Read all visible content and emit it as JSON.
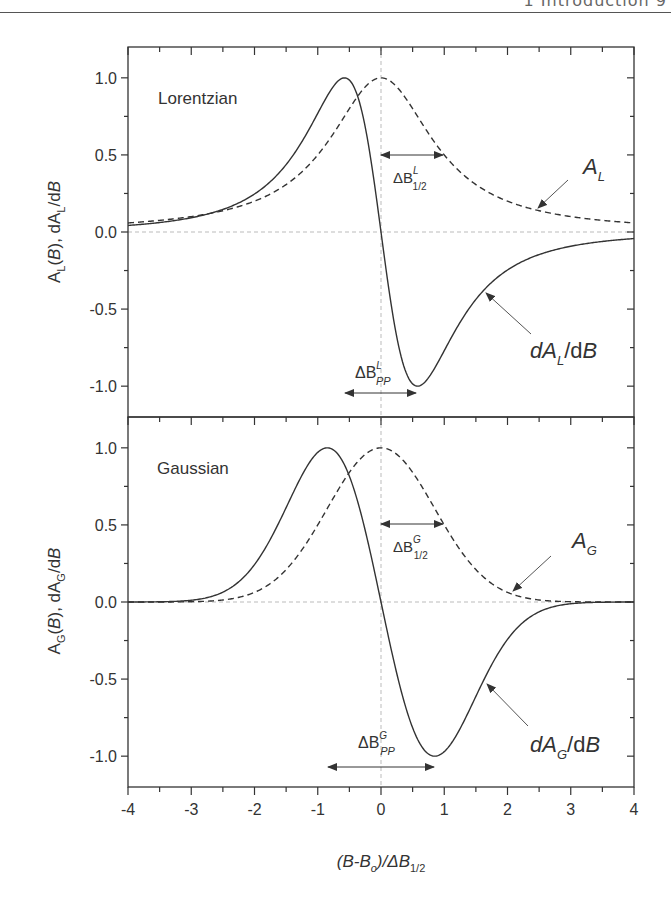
{
  "page_header": {
    "text": "1   Introduction   9"
  },
  "colors": {
    "axis": "#333333",
    "curve": "#333333",
    "guide": "#bbbbbb",
    "arrow": "#555555"
  },
  "chart_data": [
    {
      "type": "line",
      "panel": "top",
      "title": "Lorentzian",
      "xlabel": "(B-B_o)/ΔB_1/2",
      "ylabel": "A_L(B), dA_L/dB",
      "xlim": [
        -4,
        4
      ],
      "ylim": [
        -1.2,
        1.2
      ],
      "xticks": [
        -4,
        -3,
        -2,
        -1,
        0,
        1,
        2,
        3,
        4
      ],
      "yticks": [
        -1.0,
        -0.5,
        0.0,
        0.5,
        1.0
      ],
      "ytick_labels": [
        "-1.0",
        "-0.5",
        "0.0",
        "0.5",
        "1.0"
      ],
      "grid": false,
      "guides": [
        "y=0 dashed",
        "x=0 dashed"
      ],
      "series": [
        {
          "name": "A_L",
          "style": "dashed",
          "x": [
            -4,
            -3,
            -2,
            -1.5,
            -1,
            -0.5,
            0,
            0.5,
            1,
            1.5,
            2,
            3,
            4
          ],
          "y": [
            0.059,
            0.1,
            0.2,
            0.308,
            0.5,
            0.8,
            1.0,
            0.8,
            0.5,
            0.308,
            0.2,
            0.1,
            0.059
          ]
        },
        {
          "name": "dA_L/dB",
          "style": "solid",
          "x": [
            -4,
            -3,
            -2,
            -1.5,
            -1,
            -0.577,
            0,
            0.577,
            1,
            1.5,
            2,
            3,
            4
          ],
          "y": [
            0.043,
            0.092,
            0.246,
            0.438,
            0.77,
            1.0,
            0.0,
            -1.0,
            -0.77,
            -0.438,
            -0.246,
            -0.092,
            -0.043
          ]
        }
      ],
      "annotations": [
        {
          "label": "ΔB",
          "sup": "L",
          "sub": "1/2",
          "meaning": "half width at half max",
          "x_from": 0,
          "x_to": 1,
          "y": 0.5
        },
        {
          "label": "ΔB",
          "sup": "L",
          "sub": "PP",
          "meaning": "peak-to-peak width",
          "x_from": -0.577,
          "x_to": 0.577,
          "y": -1.05
        },
        {
          "label": "A",
          "sub": "L",
          "points_to": "A_L curve at x≈2.4"
        },
        {
          "label": "dA",
          "sub": "L",
          "suffix": "/dB",
          "points_to": "dA_L/dB curve at x≈1.5"
        }
      ]
    },
    {
      "type": "line",
      "panel": "bottom",
      "title": "Gaussian",
      "xlabel": "(B-B_o)/ΔB_1/2",
      "ylabel": "A_G(B), dA_G/dB",
      "xlim": [
        -4,
        4
      ],
      "ylim": [
        -1.2,
        1.2
      ],
      "xticks": [
        -4,
        -3,
        -2,
        -1,
        0,
        1,
        2,
        3,
        4
      ],
      "xtick_labels": [
        "-4",
        "-3",
        "-2",
        "-1",
        "0",
        "1",
        "2",
        "3",
        "4"
      ],
      "yticks": [
        -1.0,
        -0.5,
        0.0,
        0.5,
        1.0
      ],
      "ytick_labels": [
        "-1.0",
        "-0.5",
        "0.0",
        "0.5",
        "1.0"
      ],
      "grid": false,
      "guides": [
        "y=0 dashed",
        "x=0 dashed"
      ],
      "series": [
        {
          "name": "A_G",
          "style": "dashed",
          "x": [
            -4,
            -3,
            -2,
            -1.5,
            -1,
            -0.5,
            0,
            0.5,
            1,
            1.5,
            2,
            3,
            4
          ],
          "y": [
            0.0,
            0.002,
            0.063,
            0.21,
            0.5,
            0.841,
            1.0,
            0.841,
            0.5,
            0.21,
            0.063,
            0.002,
            0.0
          ]
        },
        {
          "name": "dA_G/dB",
          "style": "solid",
          "x": [
            -4,
            -3,
            -2,
            -1.5,
            -0.849,
            0,
            0.849,
            1.5,
            2,
            3,
            4
          ],
          "y": [
            0.0,
            0.009,
            0.181,
            0.456,
            1.0,
            0.0,
            -1.0,
            -0.456,
            -0.181,
            -0.009,
            0.0
          ]
        }
      ],
      "annotations": [
        {
          "label": "ΔB",
          "sup": "G",
          "sub": "1/2",
          "meaning": "half width at half max",
          "x_from": 0,
          "x_to": 1,
          "y": 0.5
        },
        {
          "label": "ΔB",
          "sup": "G",
          "sub": "PP",
          "meaning": "peak-to-peak width",
          "x_from": -0.849,
          "x_to": 0.849,
          "y": -1.1
        },
        {
          "label": "A",
          "sub": "G",
          "points_to": "A_G curve at x≈2.1"
        },
        {
          "label": "dA",
          "sub": "G",
          "suffix": "/dB",
          "points_to": "dA_G/dB curve at x≈1.7"
        }
      ]
    }
  ],
  "labels": {
    "top_title": "Lorentzian",
    "bottom_title": "Gaussian",
    "top_ylabel_main": "A",
    "top_ylabel_sub": "L",
    "top_ylabel_rest": "(B), dA",
    "top_ylabel_sub2": "L",
    "top_ylabel_end": "/dB",
    "bottom_ylabel_sub": "G",
    "xlabel_main": "(B-B",
    "xlabel_sub_o": "o",
    "xlabel_mid": ")/ΔB",
    "xlabel_sub": "1/2",
    "delta_B": "ΔB",
    "half_sub": "1/2",
    "pp_sub": "PP",
    "sup_L": "L",
    "sup_G": "G",
    "A": "A",
    "dA": "dA",
    "slash_dB": "/dB"
  }
}
